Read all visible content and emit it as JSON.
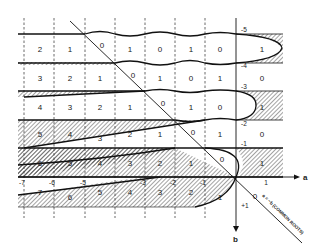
{
  "figure": {
    "axes": {
      "horizontal_label": "a",
      "vertical_label": "b",
      "a_ticks": [
        "-7",
        "-6",
        "-5",
        "-4",
        "-3",
        "-2",
        "-1",
        "1"
      ],
      "b_ticks": [
        "-5",
        "-4",
        "-3",
        "-2",
        "-1",
        "+1"
      ]
    },
    "diagonal_label": "a = −b (COMMON ROOTS)",
    "diagonal_zero": "0",
    "rows": [
      {
        "b_range": "-5..-4",
        "cells": [
          "2",
          "1",
          "0",
          "1",
          "0",
          "1",
          "0",
          "1"
        ]
      },
      {
        "b_range": "-4..-3",
        "cells": [
          "3",
          "2",
          "1",
          "0",
          "1",
          "0",
          "1",
          "0"
        ]
      },
      {
        "b_range": "-3..-2",
        "cells": [
          "4",
          "3",
          "2",
          "1",
          "0",
          "1",
          "0",
          "1"
        ]
      },
      {
        "b_range": "-2..-1",
        "cells": [
          "5",
          "4",
          "3",
          "2",
          "1",
          "0",
          "1",
          "0"
        ]
      },
      {
        "b_range": "-1..0",
        "cells": [
          "6",
          "5",
          "4",
          "3",
          "2",
          "1",
          "0",
          "1"
        ]
      },
      {
        "b_range": "0..+1",
        "cells": [
          "7",
          "6",
          "5",
          "4",
          "3",
          "2",
          "1"
        ]
      }
    ],
    "extra_labels": {
      "row2_lower": "3",
      "row4_lower": "3",
      "row6_lower": "6",
      "row5_lower": "2"
    }
  }
}
